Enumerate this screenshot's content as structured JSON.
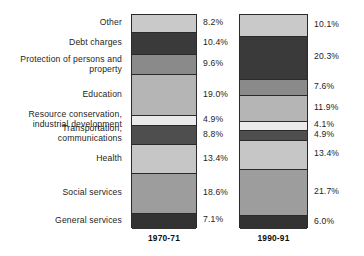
{
  "chart_data": {
    "type": "bar",
    "subtype": "stacked-percentage-column",
    "title": "",
    "subtitle": "",
    "xlabel": "",
    "ylabel": "",
    "ylim": [
      0,
      100
    ],
    "grid": false,
    "legend_position": "left-category-labels",
    "units": "%",
    "categories": [
      "Other",
      "Debt charges",
      "Protection of persons and\nproperty",
      "Education",
      "Resource conservation,\nindustrial development",
      "Transportation,\ncommunications",
      "Health",
      "Social services",
      "General services"
    ],
    "x": [
      "1970-71",
      "1990-91"
    ],
    "series": [
      {
        "name": "1970-71",
        "values": [
          8.2,
          10.4,
          9.6,
          19.0,
          4.9,
          8.8,
          13.4,
          18.6,
          7.1
        ],
        "value_labels": [
          "8.2%",
          "10.4%",
          "9.6%",
          "19.0%",
          "4.9%",
          "8.8%",
          "13.4%",
          "18.6%",
          "7.1%"
        ]
      },
      {
        "name": "1990-91",
        "values": [
          10.1,
          20.3,
          7.6,
          11.9,
          4.1,
          4.9,
          13.4,
          21.7,
          6.0
        ],
        "value_labels": [
          "10.1%",
          "20.3%",
          "7.6%",
          "11.9%",
          "4.1%",
          "4.9%",
          "13.4%",
          "21.7%",
          "6.0%"
        ]
      }
    ],
    "segment_colors": [
      "#c9c9c9",
      "#3a3a3a",
      "#8a8a8a",
      "#b5b5b5",
      "#eaeaea",
      "#4e4e4e",
      "#c6c6c6",
      "#9d9d9d",
      "#333333"
    ],
    "outline_color": "#2a2a2a",
    "text_color": "#1d1d1d"
  },
  "axis": {
    "year_1": "1970-71",
    "year_2": "1990-91"
  }
}
